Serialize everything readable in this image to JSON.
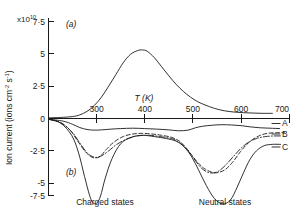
{
  "chart_data": {
    "type": "line",
    "title": "",
    "subtitle": "",
    "xlabel": "T (K)",
    "ylabel": "Ion current (ions cm",
    "ylabel_sup1": "-2",
    "ylabel_mid": " s",
    "ylabel_sup2": "-1",
    "ylabel_end": ")",
    "y_exponent_prefix": "x10",
    "y_exponent_value": "10",
    "xlim": [
      200,
      700
    ],
    "ylim": [
      -7.5,
      7.5
    ],
    "grid": false,
    "legend_position": "right-inline",
    "xticks": [
      300,
      400,
      500,
      600,
      700
    ],
    "xticklabels": [
      "300",
      "400",
      "500",
      "600",
      "700"
    ],
    "yticks": [
      7.5,
      5,
      2.5,
      0,
      -2.5,
      -5,
      -7.5
    ],
    "yticklabels": [
      "7·5",
      "5",
      "2·5",
      "0",
      "-2·5",
      "-5",
      "-7·5"
    ],
    "panel_labels": [
      {
        "name": "panel-a",
        "text": "(a)"
      },
      {
        "name": "panel-b",
        "text": "(b)"
      }
    ],
    "annotations": [
      {
        "name": "charged-states",
        "text": "Charged states"
      },
      {
        "name": "neutral-states",
        "text": "Neutral states"
      }
    ],
    "curve_labels": [
      {
        "name": "curve-label-a",
        "text": "A"
      },
      {
        "name": "curve-label-b",
        "text": "B"
      },
      {
        "name": "curve-label-c",
        "text": "C"
      }
    ],
    "series": [
      {
        "name": "upper-positive-peak",
        "style": "solid",
        "x": [
          200,
          225,
          250,
          265,
          280,
          295,
          310,
          325,
          340,
          355,
          370,
          385,
          395,
          405,
          420,
          435,
          450,
          465,
          480,
          495,
          510,
          525,
          545,
          565,
          585,
          605,
          625,
          645,
          665
        ],
        "y": [
          0.05,
          0.08,
          0.15,
          0.28,
          0.55,
          1.0,
          1.65,
          2.5,
          3.4,
          4.3,
          4.95,
          5.25,
          5.3,
          5.2,
          4.7,
          4.0,
          3.3,
          2.65,
          2.1,
          1.65,
          1.3,
          1.05,
          0.78,
          0.6,
          0.5,
          0.45,
          0.42,
          0.4,
          0.4
        ]
      },
      {
        "name": "A",
        "style": "solid",
        "x": [
          200,
          230,
          250,
          265,
          280,
          295,
          310,
          330,
          350,
          375,
          400,
          425,
          450,
          470,
          490,
          505,
          520,
          540,
          560,
          580,
          600,
          620,
          640,
          660,
          680
        ],
        "y": [
          -0.05,
          -0.2,
          -0.45,
          -0.7,
          -0.85,
          -0.9,
          -0.88,
          -0.82,
          -0.78,
          -0.75,
          -0.78,
          -0.82,
          -0.88,
          -0.95,
          -0.9,
          -0.72,
          -0.6,
          -0.52,
          -0.48,
          -0.5,
          -0.55,
          -0.65,
          -0.72,
          -0.75,
          -0.78
        ]
      },
      {
        "name": "B",
        "style": "dashed",
        "x": [
          200,
          225,
          245,
          260,
          275,
          288,
          298,
          308,
          320,
          335,
          355,
          375,
          395,
          415,
          435,
          455,
          470,
          482,
          495,
          510,
          525,
          545,
          565,
          582,
          598,
          612,
          625,
          640,
          655,
          672,
          690
        ],
        "y": [
          -0.05,
          -0.3,
          -0.9,
          -1.7,
          -2.5,
          -2.95,
          -3.05,
          -2.9,
          -2.4,
          -1.85,
          -1.4,
          -1.2,
          -1.15,
          -1.2,
          -1.3,
          -1.45,
          -1.7,
          -2.1,
          -2.7,
          -3.4,
          -3.9,
          -4.2,
          -4.0,
          -3.4,
          -2.6,
          -2.0,
          -1.6,
          -1.3,
          -1.15,
          -1.1,
          -1.1
        ]
      },
      {
        "name": "C",
        "style": "solid",
        "x": [
          200,
          225,
          248,
          262,
          275,
          285,
          292,
          300,
          308,
          318,
          332,
          350,
          372,
          395,
          420,
          445,
          465,
          482,
          498,
          512,
          528,
          545,
          562,
          578,
          592,
          605,
          618,
          632,
          648,
          665,
          682
        ],
        "y": [
          -0.05,
          -0.35,
          -1.3,
          -2.6,
          -4.5,
          -5.9,
          -6.5,
          -6.55,
          -6.0,
          -4.6,
          -3.1,
          -1.95,
          -1.45,
          -1.3,
          -1.4,
          -1.55,
          -1.75,
          -2.2,
          -3.0,
          -4.0,
          -5.2,
          -6.2,
          -6.6,
          -6.3,
          -5.3,
          -4.2,
          -3.2,
          -2.5,
          -2.1,
          -2.0,
          -2.0
        ]
      },
      {
        "name": "dashdot-mid",
        "style": "dashdot",
        "x": [
          200,
          228,
          250,
          265,
          280,
          292,
          302,
          312,
          325,
          342,
          362,
          385,
          408,
          432,
          455,
          472,
          488,
          502,
          518,
          535,
          552,
          568,
          585,
          600,
          615,
          632,
          650,
          668,
          685
        ],
        "y": [
          -0.05,
          -0.4,
          -1.1,
          -1.9,
          -2.65,
          -2.95,
          -3.0,
          -2.85,
          -2.5,
          -2.0,
          -1.6,
          -1.35,
          -1.3,
          -1.4,
          -1.55,
          -1.85,
          -2.4,
          -3.1,
          -3.85,
          -4.2,
          -4.1,
          -3.6,
          -2.9,
          -2.3,
          -1.85,
          -1.55,
          -1.4,
          -1.35,
          -1.35
        ]
      }
    ]
  }
}
